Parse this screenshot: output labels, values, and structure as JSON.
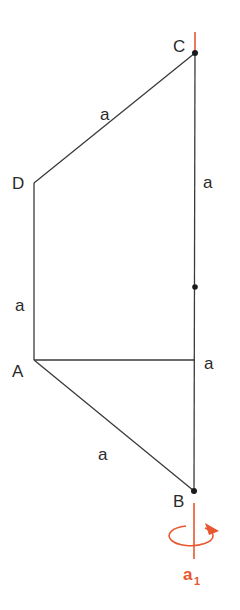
{
  "diagram": {
    "type": "geometry-rotation-figure",
    "vertices": {
      "A": {
        "label": "A",
        "x": 34,
        "y": 360
      },
      "B": {
        "label": "B",
        "x": 194,
        "y": 491
      },
      "C": {
        "label": "C",
        "x": 195,
        "y": 53
      },
      "D": {
        "label": "D",
        "x": 34,
        "y": 183
      },
      "M": {
        "label": "",
        "x": 195,
        "y": 287
      }
    },
    "edge_labels": {
      "CD": "a",
      "DA": "a",
      "AB": "a",
      "C_mid": "a",
      "A_horizontal": "a"
    },
    "axis": {
      "label": "a",
      "subscript": "1",
      "color": "#e8572f"
    },
    "colors": {
      "line": "#3a3a3a",
      "axis": "#e8572f",
      "text": "#2a2a2a"
    }
  }
}
